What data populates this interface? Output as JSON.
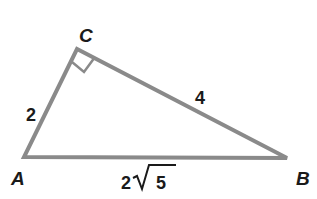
{
  "diagram": {
    "type": "right-triangle",
    "vertices": {
      "A": {
        "label": "A",
        "x": 24,
        "y": 157
      },
      "B": {
        "label": "B",
        "x": 287,
        "y": 158
      },
      "C": {
        "label": "C",
        "x": 77,
        "y": 49
      }
    },
    "right_angle_at": "C",
    "sides": {
      "AC": {
        "label": "2"
      },
      "CB": {
        "label": "4"
      },
      "AB": {
        "label_coef": "2",
        "label_radicand": "5"
      }
    },
    "colors": {
      "stroke": "#8a8a8a",
      "text": "#1a1a1a"
    }
  }
}
